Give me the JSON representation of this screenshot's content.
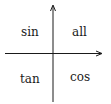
{
  "diagram": {
    "title": "",
    "quadrants": {
      "top_left": "sin",
      "top_right": "all",
      "bottom_left": "tan",
      "bottom_right": "cos"
    },
    "axes": {
      "horizontal": "arrow-right",
      "vertical": "arrow-up"
    },
    "colors": {
      "stroke": "#1a1a1a",
      "background": "#ffffff"
    }
  }
}
